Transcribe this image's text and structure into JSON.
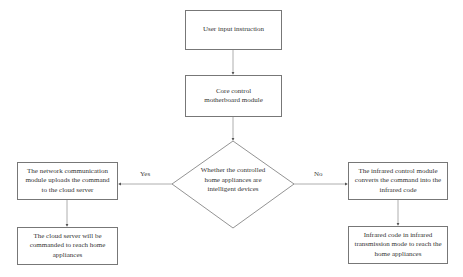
{
  "diagram": {
    "type": "flowchart",
    "nodes": {
      "start": {
        "text": "User input instruction"
      },
      "core": {
        "text": "Core control motherboard module"
      },
      "decision": {
        "text": "Whether the controlled home appliances are intelligent devices"
      },
      "yes_step1": {
        "text": "The network communication module uploads the command to the cloud server"
      },
      "yes_step2": {
        "text": "The cloud server will be commanded to reach home appliances"
      },
      "no_step1": {
        "text": "The infrared control module converts the command into the infrared code"
      },
      "no_step2": {
        "text": "Infrared code in infrared transmission mode to reach the home appliances"
      }
    },
    "edges": {
      "yes_label": "Yes",
      "no_label": "No"
    },
    "colors": {
      "line": "#888888",
      "border": "#777777",
      "text": "#333333"
    }
  }
}
